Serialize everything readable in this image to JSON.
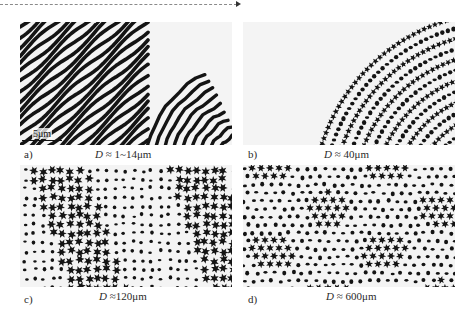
{
  "figure": {
    "top_rule": "dashed-arrow",
    "panels": [
      {
        "id": "a",
        "label": "a)",
        "caption_symbol": "D",
        "caption_rest": " ≈ 1~14μm",
        "pattern": "labyrinth-stripes"
      },
      {
        "id": "b",
        "label": "b)",
        "caption_symbol": "D",
        "caption_rest": " ≈ 40μm",
        "pattern": "stripes-with-dots"
      },
      {
        "id": "c",
        "label": "c)",
        "caption_symbol": "D",
        "caption_rest": " ≈120μm",
        "pattern": "star-hexagonal"
      },
      {
        "id": "d",
        "label": "d)",
        "caption_symbol": "D",
        "caption_rest": " ≈ 600μm",
        "pattern": "hexagonal-network"
      }
    ],
    "scale_bar": {
      "label": "5μm"
    }
  },
  "colors": {
    "dark": "#141414",
    "light": "#f4f4f4",
    "rule": "#8a8a8a"
  }
}
